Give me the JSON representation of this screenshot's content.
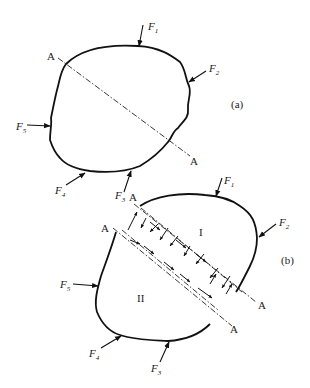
{
  "figure": {
    "panel_a": {
      "label": "(a)",
      "section_line": {
        "start_label": "A",
        "end_label": "A"
      },
      "forces": [
        {
          "name": "F",
          "sub": "1"
        },
        {
          "name": "F",
          "sub": "2"
        },
        {
          "name": "F",
          "sub": "3"
        },
        {
          "name": "F",
          "sub": "4"
        },
        {
          "name": "F",
          "sub": "5"
        }
      ]
    },
    "panel_b": {
      "label": "(b)",
      "section_lines": [
        {
          "start_label": "A",
          "end_label": "A"
        },
        {
          "start_label": "A",
          "end_label": "A"
        }
      ],
      "regions": {
        "upper": "I",
        "lower": "II"
      },
      "forces": [
        {
          "name": "F",
          "sub": "1"
        },
        {
          "name": "F",
          "sub": "2"
        },
        {
          "name": "F",
          "sub": "3"
        },
        {
          "name": "F",
          "sub": "4"
        },
        {
          "name": "F",
          "sub": "5"
        }
      ]
    }
  }
}
